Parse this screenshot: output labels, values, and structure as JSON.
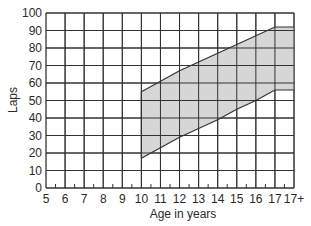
{
  "chart_data": {
    "type": "area",
    "title": "",
    "xlabel": "Age in years",
    "ylabel": "Laps",
    "x_ticks": [
      "5",
      "6",
      "7",
      "8",
      "9",
      "10",
      "11",
      "12",
      "13",
      "14",
      "15",
      "16",
      "17",
      "17+"
    ],
    "y_ticks": [
      0,
      10,
      20,
      30,
      40,
      50,
      60,
      70,
      80,
      90,
      100
    ],
    "ylim": [
      0,
      100
    ],
    "grid": true,
    "legend": null,
    "categories": [
      "10",
      "11",
      "12",
      "13",
      "14",
      "15",
      "16",
      "17",
      "17+"
    ],
    "series": [
      {
        "name": "Upper bound",
        "values": [
          55,
          61,
          67,
          72,
          77,
          82,
          87,
          92,
          92
        ]
      },
      {
        "name": "Lower bound",
        "values": [
          17,
          23,
          29,
          34,
          39,
          45,
          50,
          56,
          56
        ]
      }
    ],
    "fill_between": {
      "color": "#d6d6d6",
      "line_color": "#333333"
    }
  }
}
